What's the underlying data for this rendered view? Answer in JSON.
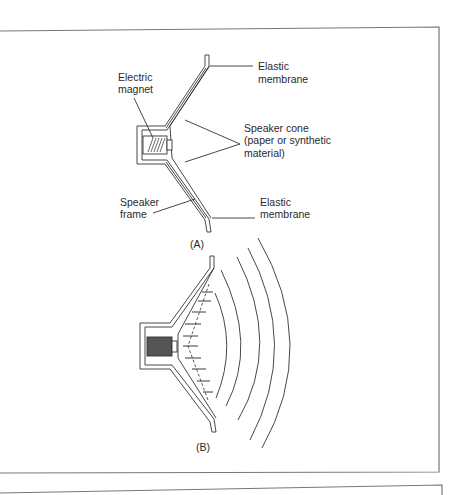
{
  "figure_a": {
    "caption": "(A)",
    "labels": {
      "electric_magnet_1": "Electric",
      "electric_magnet_2": "magnet",
      "elastic_membrane_top_1": "Elastic",
      "elastic_membrane_top_2": "membrane",
      "speaker_cone_1": "Speaker cone",
      "speaker_cone_2": "(paper or synthetic",
      "speaker_cone_3": "material)",
      "speaker_frame_1": "Speaker",
      "speaker_frame_2": "frame",
      "elastic_membrane_bottom_1": "Elastic",
      "elastic_membrane_bottom_2": "membrane"
    }
  },
  "figure_b": {
    "caption": "(B)"
  }
}
